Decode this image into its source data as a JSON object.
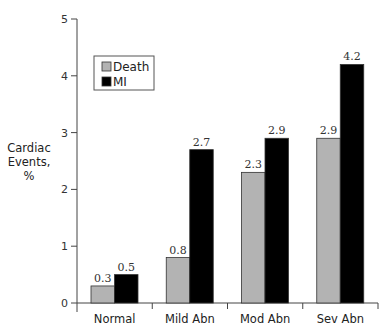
{
  "chart_data": {
    "type": "bar",
    "title": "",
    "xlabel": "",
    "ylabel": "Cardiac Events, %",
    "ylabel_lines": [
      "Cardiac",
      "Events,",
      "%"
    ],
    "ylim": [
      0,
      5
    ],
    "yticks": [
      0,
      1,
      2,
      3,
      4,
      5
    ],
    "grid": false,
    "legend_position": "upper-left",
    "categories": [
      "Normal",
      "Mild Abn",
      "Mod Abn",
      "Sev Abn"
    ],
    "series": [
      {
        "name": "Death",
        "color": "#b3b3b3",
        "values": [
          0.3,
          0.8,
          2.3,
          2.9
        ]
      },
      {
        "name": "MI",
        "color": "#000000",
        "values": [
          0.5,
          2.7,
          2.9,
          4.2
        ]
      }
    ],
    "data_labels": true
  }
}
